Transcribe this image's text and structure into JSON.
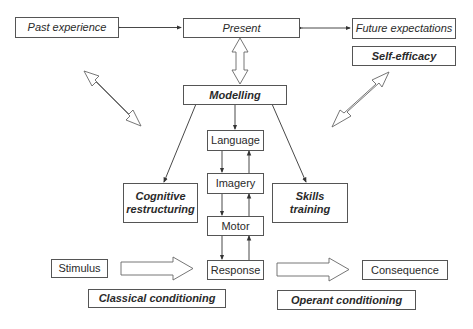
{
  "diagram": {
    "nodes": {
      "past_experience": "Past experience",
      "present": "Present",
      "future_expectations": "Future expectations",
      "self_efficacy": "Self-efficacy",
      "modelling": "Modelling",
      "language": "Language",
      "imagery": "Imagery",
      "motor": "Motor",
      "response": "Response",
      "cognitive_restructuring_line1": "Cognitive",
      "cognitive_restructuring_line2": "restructuring",
      "skills_training_line1": "Skills",
      "skills_training_line2": "training",
      "stimulus": "Stimulus",
      "consequence": "Consequence",
      "classical_conditioning": "Classical conditioning",
      "operant_conditioning": "Operant conditioning"
    },
    "edges": [
      {
        "from": "past_experience",
        "to": "present",
        "type": "double-line-arrow"
      },
      {
        "from": "present",
        "to": "future_expectations",
        "type": "double-line-arrow"
      },
      {
        "from": "present",
        "to": "modelling",
        "type": "double-block-arrow"
      },
      {
        "from": "past_experience",
        "to": "cognitive_restructuring",
        "type": "double-block-arrow"
      },
      {
        "from": "self_efficacy",
        "to": "skills_training",
        "type": "double-block-arrow"
      },
      {
        "from": "modelling",
        "to": "cognitive_restructuring",
        "type": "line-arrow"
      },
      {
        "from": "modelling",
        "to": "language",
        "type": "line-arrow"
      },
      {
        "from": "modelling",
        "to": "skills_training",
        "type": "line-arrow"
      },
      {
        "from": "language",
        "to": "imagery",
        "type": "line-arrow"
      },
      {
        "from": "imagery",
        "to": "language",
        "type": "line-arrow"
      },
      {
        "from": "imagery",
        "to": "motor",
        "type": "line-arrow"
      },
      {
        "from": "motor",
        "to": "imagery",
        "type": "line-arrow"
      },
      {
        "from": "motor",
        "to": "response",
        "type": "line-arrow"
      },
      {
        "from": "response",
        "to": "motor",
        "type": "line-arrow"
      },
      {
        "from": "stimulus",
        "to": "response",
        "type": "block-arrow"
      },
      {
        "from": "response",
        "to": "consequence",
        "type": "block-arrow"
      }
    ]
  }
}
